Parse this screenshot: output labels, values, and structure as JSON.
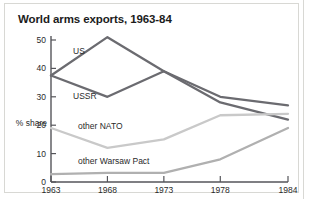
{
  "figure": {
    "title": "World arms exports, 1963-84"
  },
  "chart_data": {
    "type": "line",
    "title": "World arms exports, 1963-84",
    "xlabel": "",
    "ylabel": "% share",
    "x": [
      1963,
      1968,
      1973,
      1978,
      1984
    ],
    "xticklabels": [
      "1963",
      "1968",
      "1973",
      "1978",
      "1984"
    ],
    "yticklabels": [
      "0",
      "10",
      "20",
      "30",
      "40",
      "50"
    ],
    "yticks": [
      0,
      10,
      20,
      30,
      40,
      50
    ],
    "ylim": [
      0,
      53
    ],
    "xlim": [
      1963,
      1984
    ],
    "grid": false,
    "legend_position": "inline-labels",
    "series": [
      {
        "name": "US",
        "label": "US",
        "color": "#6b6b70",
        "values": [
          37.5,
          51.0,
          39.0,
          30.0,
          27.0
        ]
      },
      {
        "name": "USSR",
        "label": "USSR",
        "color": "#6b6b70",
        "values": [
          37.5,
          30.0,
          39.0,
          28.0,
          22.0
        ]
      },
      {
        "name": "other NATO",
        "label": "other NATO",
        "color": "#c9c9c9",
        "values": [
          19.0,
          12.0,
          15.0,
          23.5,
          24.0
        ]
      },
      {
        "name": "other Warsaw Pact",
        "label": "other Warsaw Pact",
        "color": "#b0b0b0",
        "values": [
          2.8,
          3.2,
          3.2,
          8.0,
          19.0
        ]
      }
    ]
  },
  "colors": {
    "frame": "#d8d8d4",
    "axis": "#55555a",
    "text": "#2a2a2a",
    "title": "#1c1c1c",
    "background": "#ffffff"
  }
}
